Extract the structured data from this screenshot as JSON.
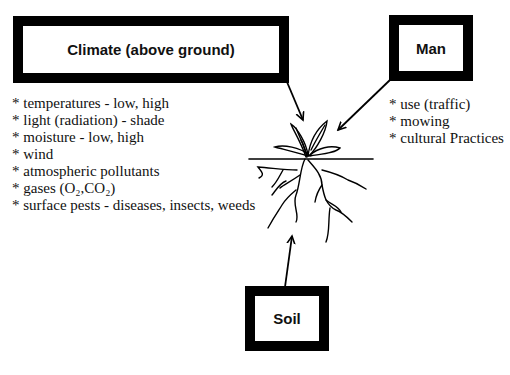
{
  "boxes": {
    "climate": "Climate (above ground)",
    "man": "Man",
    "soil": "Soil"
  },
  "climate_factors": [
    "* temperatures - low, high",
    "* light (radiation) - shade",
    "* moisture - low, high",
    "* wind",
    "* atmospheric pollutants",
    "* gases (O₂,CO₂)",
    "* surface pests - diseases, insects, weeds"
  ],
  "man_factors": [
    "* use (traffic)",
    "* mowing",
    "* cultural Practices"
  ],
  "colors": {
    "ink": "#000000",
    "background": "#ffffff"
  }
}
